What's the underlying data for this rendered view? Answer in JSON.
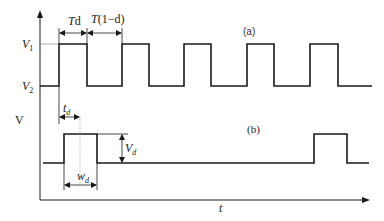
{
  "diagram": {
    "type": "pulse-waveform",
    "axes": {
      "y_label": "V",
      "x_label": "t"
    },
    "waveform_a": {
      "label": "(a)",
      "levels": {
        "high": "V1",
        "low": "V2"
      },
      "high_label_main": "V",
      "high_label_sub": "1",
      "low_label_main": "V",
      "low_label_sub": "2",
      "on_time_label": "Td",
      "off_time_label": "T(1−d)",
      "pulse_count": 5
    },
    "waveform_b": {
      "label": "(b)",
      "delay_label_main": "t",
      "delay_label_sub": "d",
      "amplitude_label_main": "V",
      "amplitude_label_sub": "d",
      "width_label_main": "w",
      "width_label_sub": "d",
      "pulse_count": 2
    },
    "colors": {
      "line": "#1a1a1a",
      "guide": "#888888"
    }
  }
}
